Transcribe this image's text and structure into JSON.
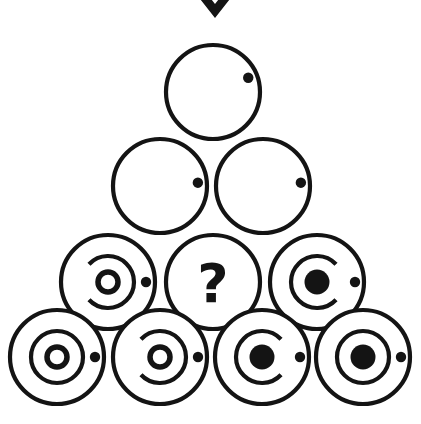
{
  "canvas": {
    "width": 421,
    "height": 424,
    "background_color": "#ffffff",
    "ink_color": "#141414",
    "stroke_width": 4.2
  },
  "figure": {
    "kind": "abstract-reasoning-matrix",
    "arrangement": "pyramid",
    "row_counts": [
      1,
      2,
      3,
      4
    ],
    "total_cells": 10,
    "missing_cell_symbol": "?"
  },
  "marker": {
    "name": "chevron-down-marker",
    "shape": "chevron-down",
    "description": "Thick downward chevron partially cropped at the top edge, centred above the pyramid apex",
    "center_x": 215,
    "apex_y": 18,
    "half_width": 22,
    "top_y": -10,
    "thickness": 11,
    "color": "#141414"
  },
  "legend": {
    "satellite_dot": "small filled dot on the right edge of every circle",
    "ring_states": [
      "none",
      "arc-open-left",
      "arc-open-right",
      "full-ring"
    ],
    "core_states": [
      "none",
      "small-hollow-ring",
      "filled-disc"
    ]
  },
  "cells": [
    {
      "id": "r1c1",
      "label": "row1-circle1",
      "row": 1,
      "col": 1,
      "cx": 213,
      "cy": 92,
      "r": 47,
      "ring": "none",
      "core": "none",
      "dot": true,
      "dot_angle_deg": -22,
      "is_question": false,
      "question_text": ""
    },
    {
      "id": "r2c1",
      "label": "row2-circle1",
      "row": 2,
      "col": 1,
      "cx": 160,
      "cy": 186,
      "r": 47,
      "ring": "none",
      "core": "none",
      "dot": true,
      "dot_angle_deg": -5,
      "is_question": false,
      "question_text": ""
    },
    {
      "id": "r2c2",
      "label": "row2-circle2",
      "row": 2,
      "col": 2,
      "cx": 263,
      "cy": 186,
      "r": 47,
      "ring": "none",
      "core": "none",
      "dot": true,
      "dot_angle_deg": -5,
      "is_question": false,
      "question_text": ""
    },
    {
      "id": "r3c1",
      "label": "row3-circle1",
      "row": 3,
      "col": 1,
      "cx": 108,
      "cy": 282,
      "r": 47,
      "ring": "arc-open-left",
      "core": "small-hollow-ring",
      "dot": true,
      "dot_angle_deg": 0,
      "is_question": false,
      "question_text": ""
    },
    {
      "id": "r3c2",
      "label": "row3-circle2-missing",
      "row": 3,
      "col": 2,
      "cx": 213,
      "cy": 282,
      "r": 47,
      "ring": "none",
      "core": "none",
      "dot": false,
      "dot_angle_deg": 0,
      "is_question": true,
      "question_text": "?"
    },
    {
      "id": "r3c3",
      "label": "row3-circle3",
      "row": 3,
      "col": 3,
      "cx": 317,
      "cy": 282,
      "r": 47,
      "ring": "arc-open-right",
      "core": "filled-disc",
      "dot": true,
      "dot_angle_deg": 0,
      "is_question": false,
      "question_text": ""
    },
    {
      "id": "r4c1",
      "label": "row4-circle1",
      "row": 4,
      "col": 1,
      "cx": 57,
      "cy": 357,
      "r": 47,
      "ring": "full-ring",
      "core": "small-hollow-ring",
      "dot": true,
      "dot_angle_deg": 0,
      "is_question": false,
      "question_text": ""
    },
    {
      "id": "r4c2",
      "label": "row4-circle2",
      "row": 4,
      "col": 2,
      "cx": 160,
      "cy": 357,
      "r": 47,
      "ring": "arc-open-left",
      "core": "small-hollow-ring",
      "dot": true,
      "dot_angle_deg": 0,
      "is_question": false,
      "question_text": ""
    },
    {
      "id": "r4c3",
      "label": "row4-circle3",
      "row": 4,
      "col": 3,
      "cx": 262,
      "cy": 357,
      "r": 47,
      "ring": "arc-open-right",
      "core": "filled-disc",
      "dot": true,
      "dot_angle_deg": 0,
      "is_question": false,
      "question_text": ""
    },
    {
      "id": "r4c4",
      "label": "row4-circle4",
      "row": 4,
      "col": 4,
      "cx": 363,
      "cy": 357,
      "r": 47,
      "ring": "full-ring",
      "core": "filled-disc",
      "dot": true,
      "dot_angle_deg": 0,
      "is_question": false,
      "question_text": ""
    }
  ],
  "geometry": {
    "middle_ring_radius": 26,
    "core_ring_radius": 10,
    "core_ring_stroke": 5.5,
    "core_disc_radius": 12.5,
    "dot_radius": 5.2,
    "dot_offset_from_edge": 9,
    "arc_gap_deg": 86
  }
}
